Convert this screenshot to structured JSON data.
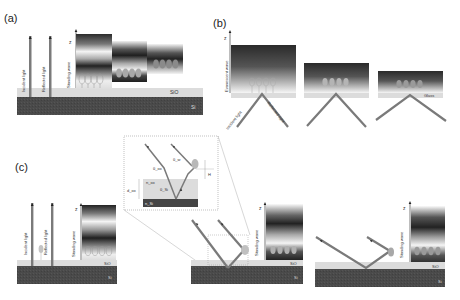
{
  "figure": {
    "panels": [
      {
        "id": "a",
        "label": "(a)",
        "axis_label": "z",
        "beam_labels": [
          "Incident light",
          "Reflected light"
        ],
        "wave_label": "Standing wave",
        "layers": [
          "SiO",
          "Si"
        ]
      },
      {
        "id": "b",
        "label": "(b)",
        "axis_label": "z",
        "beam_labels": [
          "Incident light",
          "Reflected light"
        ],
        "wave_label": "Evanescent wave",
        "layers": [
          "Glass"
        ]
      },
      {
        "id": "c",
        "label": "(c)",
        "axis_label": "z",
        "beam_labels": [
          "Incident light",
          "Reflected light"
        ],
        "wave_label": "Standing wave",
        "layers": [
          "SiO",
          "Si"
        ],
        "sub_panels": [
          {
            "wave_label": "Standing wave",
            "layers": [
              "SiO",
              "Si"
            ],
            "axis_label": "z"
          },
          {
            "wave_label": "Standing wave",
            "layers": [
              "SiO",
              "Si"
            ],
            "axis_label": "z"
          }
        ],
        "inset": {
          "symbols": {
            "theta_w": "θ_w",
            "theta_ox": "θ_ox",
            "theta_si": "θ_Si",
            "n_ox": "n_ox",
            "n_si": "n_Si",
            "d_ox": "d_ox",
            "H": "H"
          }
        }
      }
    ],
    "colors": {
      "substrate": "#4a4a4a",
      "oxide": "#d9d9d9",
      "beam": "#7a7a7a",
      "cell": "#a0a0a0",
      "dark_band": "#2a2a2a"
    }
  }
}
